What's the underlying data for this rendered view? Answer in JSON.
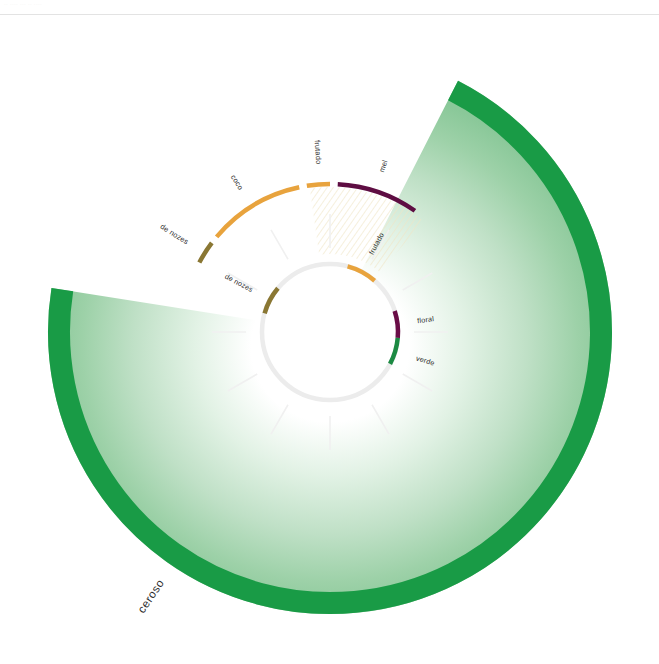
{
  "topbar": {
    "faint_text": "·· ···· ··· ·· ····"
  },
  "chart_data": {
    "type": "pie",
    "title": "",
    "subtitle": "",
    "xlabel": "",
    "ylabel": "",
    "grid": false,
    "legend_position": "none",
    "center": {
      "x": 330,
      "y": 332
    },
    "rings": [
      {
        "name": "outer",
        "radius": 282,
        "thickness": 22,
        "fill": "radial-gradient-green",
        "segments": [
          {
            "label": "ceroso",
            "value": 252,
            "start_angle": -63,
            "end_angle": 189,
            "color": "#199b46",
            "fill_color": "#8fcb9a",
            "label_angle": 124,
            "label_radius": 300
          }
        ]
      },
      {
        "name": "middle",
        "radius": 148,
        "thickness": 4.5,
        "segments": [
          {
            "label": "de nozes",
            "value": 9,
            "start_angle": 208,
            "end_angle": 217,
            "color": "#8a7733",
            "label_angle": 212,
            "label_radius": 168
          },
          {
            "label": "coco",
            "value": 38,
            "start_angle": 220,
            "end_angle": 258,
            "color": "#E8A33D",
            "label_angle": 238,
            "label_radius": 168
          },
          {
            "label": "frutado",
            "value": 9,
            "start_angle": 261,
            "end_angle": 270,
            "color": "#E8A33D",
            "label_angle": 266,
            "label_radius": 168
          },
          {
            "label": "mel",
            "value": 32,
            "start_angle": 273,
            "end_angle": 305,
            "color": "#5E0D42",
            "label_angle": 288,
            "label_radius": 168
          }
        ]
      },
      {
        "name": "inner",
        "radius": 68,
        "thickness": 4.5,
        "track_color": "#ececec",
        "segments": [
          {
            "label": "frutado",
            "value": 26,
            "start_angle": 285,
            "end_angle": 311,
            "color": "#E8A33D",
            "label_angle": 298,
            "label_radius": 88
          },
          {
            "label": "floral",
            "value": 23,
            "start_angle": 342,
            "end_angle": 365,
            "color": "#6A0D47",
            "label_angle": 353,
            "label_radius": 88
          },
          {
            "label": "verde",
            "value": 23,
            "start_angle": 365,
            "end_angle": 388,
            "color": "#1C8A43",
            "label_angle": 377,
            "label_radius": 90
          },
          {
            "label": "de nozes",
            "value": 24,
            "start_angle": 196,
            "end_angle": 220,
            "color": "#8A7733",
            "label_angle": 208,
            "label_radius": 88
          }
        ]
      }
    ],
    "spokes": {
      "count": 12,
      "color": "#f0f0f0",
      "inner_radius": 78,
      "outer_radius": 118
    },
    "hatch_region": {
      "color": "#f3ecd2",
      "start_angle": 262,
      "end_angle": 310,
      "inner_radius": 78,
      "outer_radius": 145
    },
    "palette": {
      "green_strong": "#199b46",
      "green_light": "#8fcb9a",
      "orange": "#E8A33D",
      "purple": "#5E0D42",
      "olive": "#8A7733",
      "green_inner": "#1C8A43",
      "track_gray": "#ececec",
      "label_text": "#2b2b2b"
    }
  }
}
